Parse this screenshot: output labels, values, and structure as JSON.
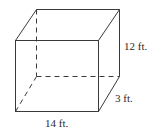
{
  "figure": {
    "type": "rectangular prism",
    "labels": {
      "height": "12 ft.",
      "depth": "3 ft.",
      "width": "14 ft."
    }
  }
}
